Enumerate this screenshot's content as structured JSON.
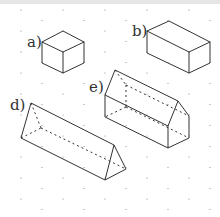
{
  "figure": {
    "grid": "isometric-dot",
    "shapes": [
      {
        "id": "a",
        "label": "a)",
        "kind": "cube"
      },
      {
        "id": "b",
        "label": "b)",
        "kind": "cuboid"
      },
      {
        "id": "d",
        "label": "d)",
        "kind": "triangular-prism"
      },
      {
        "id": "e",
        "label": "e)",
        "kind": "house-prism (pentagonal prism)"
      }
    ]
  },
  "colors": {
    "line": "#333333",
    "dot": "#888888",
    "background": "#ffffff"
  }
}
